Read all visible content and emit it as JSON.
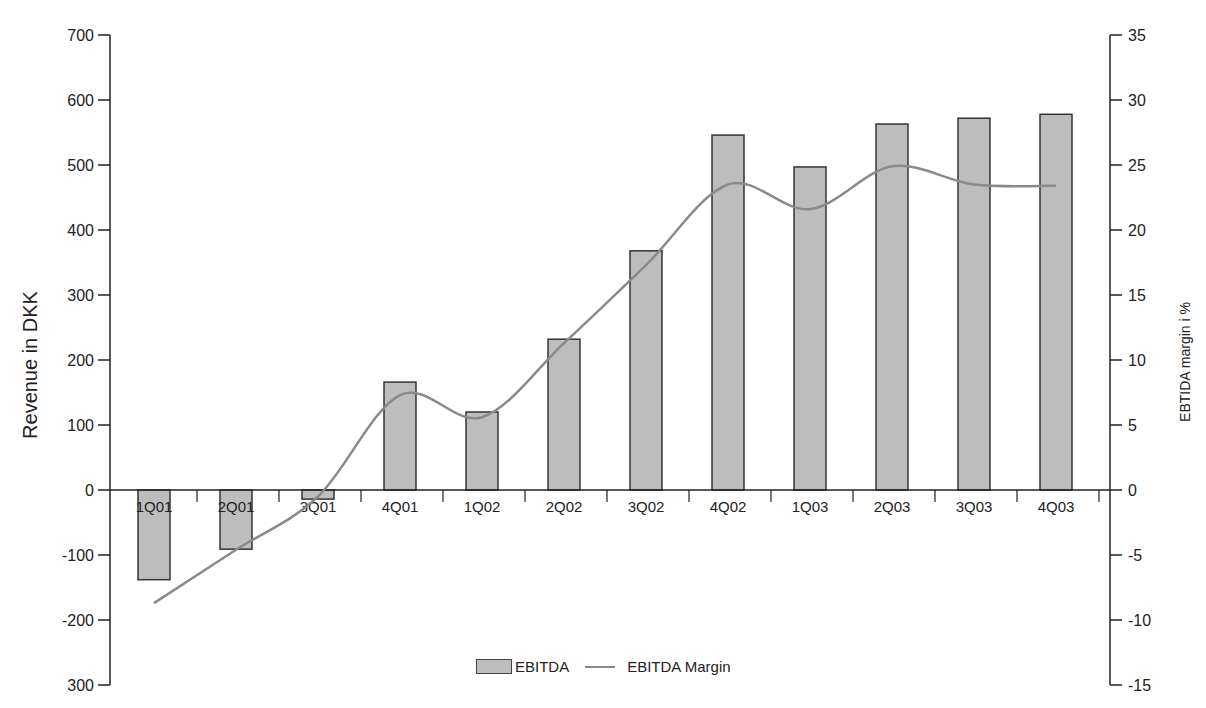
{
  "chart_data": {
    "type": "bar",
    "title": "",
    "xlabel": "",
    "ylabel": "Revenue in DKK",
    "y2label": "EBTIDA margin i %",
    "categories": [
      "1Q01",
      "2Q01",
      "3Q01",
      "4Q01",
      "1Q02",
      "2Q02",
      "3Q02",
      "4Q02",
      "1Q03",
      "2Q03",
      "3Q03",
      "4Q03"
    ],
    "series": [
      {
        "name": "EBITDA",
        "type": "bar",
        "axis": "left",
        "color": "#bdbdbd",
        "values": [
          -138,
          -91,
          -14,
          166,
          120,
          232,
          368,
          546,
          497,
          563,
          572,
          578
        ]
      },
      {
        "name": "EBITDA Margin",
        "type": "line",
        "axis": "right",
        "color": "#8a8a8a",
        "smooth": true,
        "values": [
          -8.7,
          -4.6,
          -0.5,
          7.3,
          5.6,
          11.3,
          17.3,
          23.5,
          21.6,
          24.9,
          23.5,
          23.4
        ]
      }
    ],
    "ylim": [
      -300,
      700
    ],
    "y2lim": [
      -15,
      35
    ],
    "yticks": [
      "700",
      "600",
      "500",
      "400",
      "300",
      "200",
      "100",
      "0",
      "-100",
      "-200",
      "300"
    ],
    "y2ticks": [
      "35",
      "30",
      "25",
      "20",
      "15",
      "10",
      "5",
      "0",
      "-5",
      "-10",
      "-15"
    ],
    "grid": false,
    "legend_position": "bottom"
  },
  "legend": {
    "bar_label": "EBITDA",
    "line_label": "EBITDA Margin"
  },
  "axes": {
    "left_title": "Revenue in DKK",
    "right_title": "EBTIDA margin i %"
  }
}
